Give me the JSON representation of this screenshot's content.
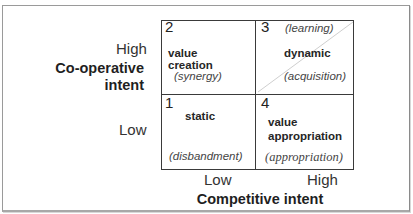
{
  "diagram": {
    "y_axis": {
      "title_line1": "Co-operative",
      "title_line2": "intent",
      "high_label": "High",
      "low_label": "Low"
    },
    "x_axis": {
      "title": "Competitive intent",
      "low_label": "Low",
      "high_label": "High"
    },
    "quadrants": [
      {
        "number": "2",
        "position": "top-left",
        "main": "value creation",
        "sub": "(synergy)"
      },
      {
        "number": "3",
        "position": "top-right",
        "main": "dynamic",
        "top_note": "(learning)",
        "sub": "(acquisition)"
      },
      {
        "number": "1",
        "position": "bottom-left",
        "main": "static",
        "sub": "(disbandment)"
      },
      {
        "number": "4",
        "position": "bottom-right",
        "main_line1": "value",
        "main_line2": "appropriation",
        "sub": "(appropriation)"
      }
    ]
  }
}
